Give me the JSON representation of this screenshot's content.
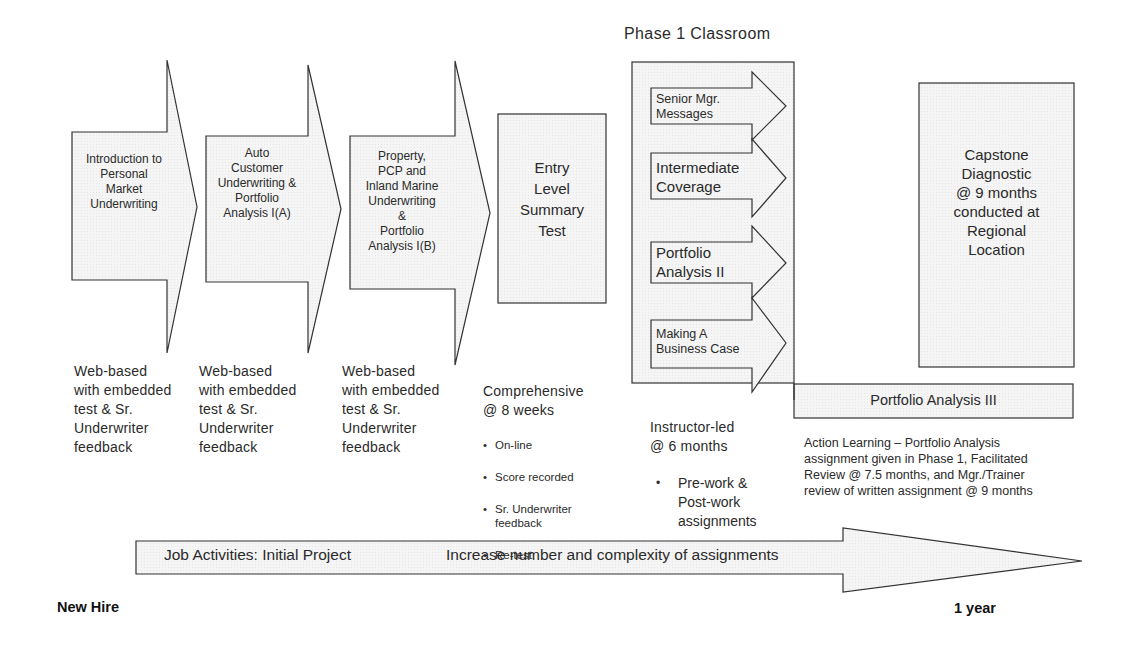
{
  "diagram": {
    "title": "Phase 1 Classroom",
    "colors": {
      "fill": "#f4f4f4",
      "stroke": "#333333",
      "text": "#2a2a2a"
    },
    "stages": [
      {
        "id": "intro",
        "shape": "arrow",
        "label": "Introduction to\nPersonal\nMarket\nUnderwriting",
        "description": "Web-based\nwith embedded\ntest & Sr.\nUnderwriter\nfeedback"
      },
      {
        "id": "auto",
        "shape": "arrow",
        "label": "Auto\nCustomer\nUnderwriting &\nPortfolio\nAnalysis I(A)",
        "description": "Web-based\nwith embedded\ntest & Sr.\nUnderwriter\nfeedback"
      },
      {
        "id": "property",
        "shape": "arrow",
        "label": "Property,\nPCP and\nInland Marine\nUnderwriting\n&\nPortfolio\nAnalysis I(B)",
        "description": "Web-based\nwith embedded\ntest & Sr.\nUnderwriter\nfeedback"
      },
      {
        "id": "entry-test",
        "shape": "box",
        "label": "Entry\nLevel\nSummary\nTest",
        "description_heading": "Comprehensive\n  @ 8 weeks",
        "bullets": [
          "On-line",
          "Score recorded",
          "Sr. Underwriter\nfeedback",
          "Re-test"
        ]
      },
      {
        "id": "phase1",
        "shape": "group",
        "items": [
          {
            "label": "Senior Mgr.\nMessages"
          },
          {
            "label": "Intermediate\nCoverage"
          },
          {
            "label": "Portfolio\nAnalysis II"
          },
          {
            "label": "Making A\nBusiness Case"
          }
        ],
        "description_heading": "Instructor-led\n@ 6 months",
        "bullets": [
          "Pre-work &\nPost-work\nassignments"
        ]
      },
      {
        "id": "capstone",
        "shape": "box",
        "label": "Capstone\nDiagnostic\n@ 9 months\nconducted at\nRegional\nLocation"
      }
    ],
    "portfolio_analysis_iii": {
      "label": "Portfolio Analysis III",
      "description": "Action Learning – Portfolio Analysis\nassignment given in Phase 1, Facilitated\nReview @ 7.5 months, and Mgr./Trainer\nreview of written assignment @ 9 months"
    },
    "timeline": {
      "label_left": "Job Activities: Initial Project",
      "label_right": "Increase number and complexity of assignments",
      "start": "New Hire",
      "end": "1 year"
    }
  }
}
